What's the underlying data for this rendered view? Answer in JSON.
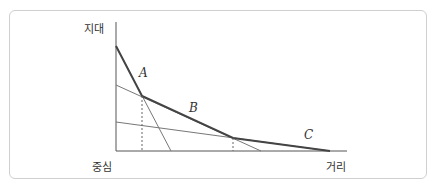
{
  "diagram": {
    "caption_cropped": true,
    "axes": {
      "y_label": "지대",
      "origin_label": "중심",
      "x_label": "거리"
    },
    "lines": [
      {
        "label": "A",
        "from": [
          116,
          46
        ],
        "to": [
          171,
          151
        ]
      },
      {
        "label": "B",
        "from": [
          116,
          85
        ],
        "to": [
          261,
          151
        ]
      },
      {
        "label": "C",
        "from": [
          116,
          122
        ],
        "to": [
          330,
          151
        ]
      }
    ],
    "intersections": [
      {
        "name": "A-B",
        "point": [
          142,
          96
        ]
      },
      {
        "name": "B-C",
        "point": [
          233,
          138
        ]
      }
    ],
    "envelope": [
      [
        116,
        46
      ],
      [
        142,
        96
      ],
      [
        233,
        138
      ],
      [
        330,
        151
      ]
    ],
    "colors": {
      "frame": "#cfcfcf",
      "thin_line": "#777777",
      "envelope": "#444444",
      "axis": "#555555",
      "dashed": "#666666"
    }
  }
}
